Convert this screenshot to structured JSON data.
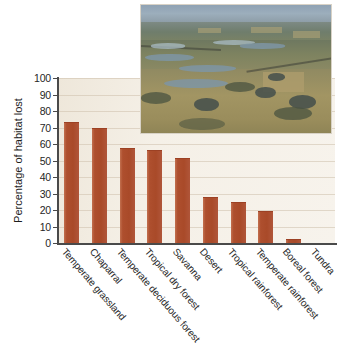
{
  "chart_data": {
    "type": "bar",
    "title": "",
    "xlabel": "",
    "ylabel": "Percentage of habitat lost",
    "ylim": [
      0,
      100
    ],
    "ytick_step": 10,
    "grid": true,
    "legend": "none",
    "bar_color": "#ae4f2e",
    "plot_background": "#f4efe6",
    "categories": [
      "Temperate grassland",
      "Chaparral",
      "Temperate deciduous forest",
      "Tropical dry forest",
      "Savanna",
      "Desert",
      "Tropical rainforest",
      "Temperate rainforest",
      "Boreal forest",
      "Tundra"
    ],
    "values": [
      73,
      69,
      57,
      56,
      51,
      27,
      24,
      19,
      2,
      0
    ],
    "ytick_labels": [
      "0",
      "10",
      "20",
      "30",
      "40",
      "50",
      "60",
      "70",
      "80",
      "90",
      "100"
    ]
  },
  "inset": {
    "name": "aerial-landscape-photo",
    "description": "Aerial photograph of prairie pothole wetlands and farmland"
  }
}
